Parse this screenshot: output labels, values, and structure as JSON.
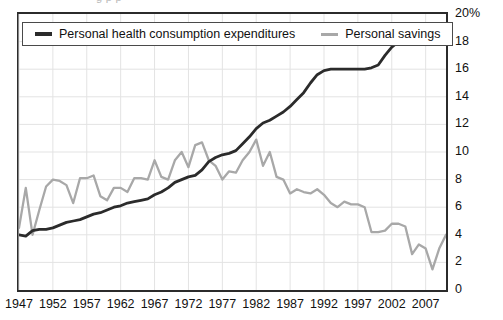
{
  "clipped_title_fragment": "g    p     p",
  "legend": {
    "items": [
      {
        "label": "Personal health consumption expenditures",
        "color": "#2b2b2b",
        "swatch": "dark-line-swatch"
      },
      {
        "label": "Personal savings",
        "color": "#a8a8a8",
        "swatch": "gray-line-swatch"
      }
    ]
  },
  "axes": {
    "y_ticks": [
      "20%",
      "18",
      "16",
      "14",
      "12",
      "10",
      "8",
      "6",
      "4",
      "2",
      "0"
    ],
    "x_ticks": [
      "1947",
      "1952",
      "1957",
      "1962",
      "1967",
      "1972",
      "1977",
      "1982",
      "1987",
      "1992",
      "1997",
      "2002",
      "2007"
    ]
  },
  "chart_data": {
    "type": "line",
    "title": "",
    "xlabel": "",
    "ylabel": "",
    "xlim": [
      1947,
      2010
    ],
    "ylim": [
      0,
      20
    ],
    "y_unit": "percent",
    "grid": true,
    "legend_position": "top-left",
    "x": [
      1947,
      1948,
      1949,
      1950,
      1951,
      1952,
      1953,
      1954,
      1955,
      1956,
      1957,
      1958,
      1959,
      1960,
      1961,
      1962,
      1963,
      1964,
      1965,
      1966,
      1967,
      1968,
      1969,
      1970,
      1971,
      1972,
      1973,
      1974,
      1975,
      1976,
      1977,
      1978,
      1979,
      1980,
      1981,
      1982,
      1983,
      1984,
      1985,
      1986,
      1987,
      1988,
      1989,
      1990,
      1991,
      1992,
      1993,
      1994,
      1995,
      1996,
      1997,
      1998,
      1999,
      2000,
      2001,
      2002,
      2003,
      2004,
      2005,
      2006,
      2007,
      2008,
      2009,
      2010
    ],
    "series": [
      {
        "name": "Personal health consumption expenditures",
        "color": "#2b2b2b",
        "values": [
          4.0,
          3.9,
          4.3,
          4.4,
          4.4,
          4.5,
          4.7,
          4.9,
          5.0,
          5.1,
          5.3,
          5.5,
          5.6,
          5.8,
          6.0,
          6.1,
          6.3,
          6.4,
          6.5,
          6.6,
          6.9,
          7.1,
          7.4,
          7.8,
          8.0,
          8.2,
          8.3,
          8.7,
          9.3,
          9.6,
          9.8,
          9.9,
          10.1,
          10.6,
          11.1,
          11.7,
          12.1,
          12.3,
          12.6,
          12.9,
          13.3,
          13.8,
          14.3,
          15.0,
          15.6,
          15.9,
          16.0,
          16.0,
          16.0,
          16.0,
          16.0,
          16.0,
          16.1,
          16.3,
          17.0,
          17.6,
          18.0,
          18.2,
          18.3,
          18.5,
          18.4,
          18.5,
          18.6,
          19.0
        ]
      },
      {
        "name": "Personal savings",
        "color": "#a8a8a8",
        "values": [
          4.5,
          7.4,
          4.0,
          5.8,
          7.5,
          8.0,
          7.9,
          7.6,
          6.3,
          8.1,
          8.1,
          8.3,
          6.8,
          6.5,
          7.4,
          7.4,
          7.1,
          8.1,
          8.1,
          8.0,
          9.4,
          8.2,
          8.0,
          9.4,
          10.0,
          8.9,
          10.5,
          10.7,
          9.4,
          9.0,
          8.0,
          8.6,
          8.5,
          9.4,
          10.0,
          10.9,
          9.0,
          10.0,
          8.2,
          8.0,
          7.0,
          7.3,
          7.1,
          7.0,
          7.3,
          6.9,
          6.3,
          6.0,
          6.4,
          6.2,
          6.2,
          6.0,
          4.2,
          4.2,
          4.3,
          4.8,
          4.8,
          4.6,
          2.6,
          3.3,
          3.0,
          1.5,
          3.0,
          4.0
        ]
      }
    ]
  }
}
